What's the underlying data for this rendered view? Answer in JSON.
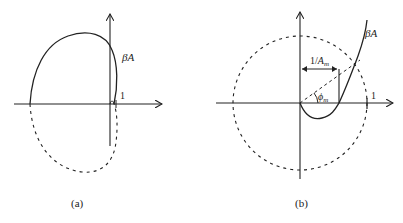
{
  "figure": {
    "panels": [
      {
        "id": "a",
        "caption": "(a)",
        "curve_label_main": "β",
        "curve_label_sub": "A",
        "unit_label": "1",
        "description": "Nyquist plot of βA encircling the point 1 (unstable)"
      },
      {
        "id": "b",
        "caption": "(b)",
        "curve_label_main": "β",
        "curve_label_sub": "A",
        "unit_label": "1",
        "gain_margin_label_prefix": "1/",
        "gain_margin_label_var": "A",
        "gain_margin_label_sub": "m",
        "phase_margin_label_var": "ϕ",
        "phase_margin_label_sub": "m",
        "description": "Nyquist plot with unit circle showing gain margin 1/A_m and phase margin ϕ_m"
      }
    ],
    "colors": {
      "stroke": "#222222",
      "background": "#ffffff"
    }
  }
}
